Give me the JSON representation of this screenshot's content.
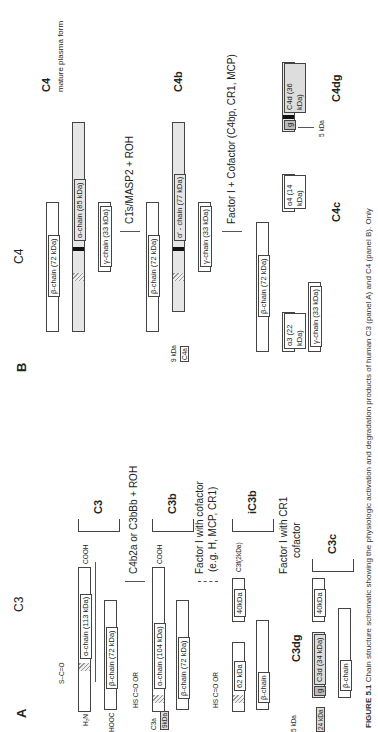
{
  "figure": {
    "caption_label": "FIGURE 5.1",
    "caption_text": "Chain structure schematic showing the physiologic activation and degradation products of human C3 (panel A) and C4 (panel B). Only"
  },
  "panel_a": {
    "letter": "A",
    "title": "C3",
    "native": {
      "name": "C3",
      "alpha_chain": "α-chain (113 kDa)",
      "beta_chain": "β-chain (72 kDa)",
      "n_term": "H₂N",
      "c_term_alpha": "COOH",
      "c_term_beta": "HOOC",
      "thioester": "S–C=O"
    },
    "step1": {
      "enzyme": "C4b2a or C3bBb + ROH",
      "fragment_name": "C3a",
      "fragment_size": "9kDa"
    },
    "c3b": {
      "name": "C3b",
      "alpha_chain": "α-chain (104 kDa)",
      "beta_chain": "β-chain (72 kDa)",
      "c_term": "COOH",
      "thioester": "HS C=O OR"
    },
    "step2": {
      "enzyme_line1": "Factor I with cofactor",
      "enzyme_line2": "(e.g. H, MCP, CR1)"
    },
    "ic3b": {
      "name": "iC3b",
      "seg1": "62 kDa",
      "seg2": "40kDa",
      "released": "C3f(2kDa)",
      "beta_chain": "β-chain",
      "thioester": "HS C=O OR"
    },
    "step3": {
      "enzyme_line1": "Factor I with CR1",
      "enzyme_line2": "cofactor"
    },
    "c3dg": {
      "name": "C3dg",
      "seg_g": "g",
      "seg_d": "C3d (34 kDa)",
      "small_frag": "5 kDa",
      "seg_24": "24 kDa"
    },
    "c3c": {
      "name": "C3c",
      "seg": "40kDa",
      "beta_chain": "β-chain"
    }
  },
  "panel_b": {
    "letter": "B",
    "title": "C4",
    "native": {
      "name": "C4",
      "subtitle": "mature plasma form",
      "beta_chain": "β-chain (72 kDa)",
      "alpha_chain": "α-chain (85 kDa)",
      "gamma_chain": "γ-chain (33 kDa)"
    },
    "step1": {
      "enzyme": "C1̄s/MASP2 + ROH",
      "fragment_name": "C4a",
      "fragment_size": "9 kDa"
    },
    "c4b": {
      "name": "C4b",
      "beta_chain": "β-chain (72 kDa)",
      "alpha_chain": "α′ - chain (77 kDa)",
      "gamma_chain": "γ-chain (33 kDa)"
    },
    "step2": {
      "enzyme": "Factor I + Cofactor (C4bp, CR1, MCP)"
    },
    "c4c": {
      "name": "C4c",
      "beta_chain": "β-chain (72 kDa)",
      "alpha3": "α3 (22 kDa)",
      "alpha4": "α4 (14 kDa)",
      "gamma_chain": "γ-chain (33 kDa)"
    },
    "c4dg": {
      "name": "C4dg",
      "seg_g": "g",
      "seg_d": "C4d (36 kDa)",
      "small_frag": "5 kDa"
    }
  },
  "terminals": {
    "n": "N",
    "c": "C",
    "ss": "S–S"
  }
}
